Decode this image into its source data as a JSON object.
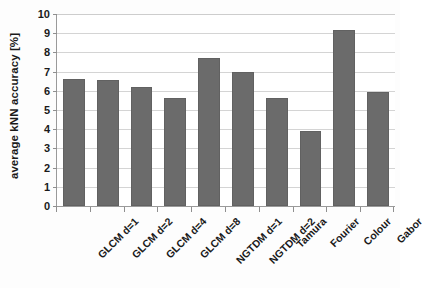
{
  "chart_data": {
    "type": "bar",
    "title": "",
    "subtitle": "",
    "xlabel": "",
    "ylabel": "average kNN accuracy [%]",
    "categories": [
      "GLCM d=1",
      "GLCM d=2",
      "GLCM d=4",
      "GLCM d=8",
      "NGTDM d=1",
      "NGTDM d=2",
      "Tamura",
      "Fourier",
      "Colour",
      "Gabor"
    ],
    "values": [
      6.6,
      6.55,
      6.2,
      5.65,
      7.7,
      7.0,
      5.6,
      3.9,
      9.15,
      5.95
    ],
    "ylim": [
      0,
      10
    ],
    "xlim_note": "categorical",
    "ytick_labels": [
      "0",
      "1",
      "2",
      "3",
      "4",
      "5",
      "6",
      "7",
      "8",
      "9",
      "10"
    ],
    "ytick_values": [
      0,
      1,
      2,
      3,
      4,
      5,
      6,
      7,
      8,
      9,
      10
    ],
    "grid": "horizontal",
    "legend": "none",
    "bar_color": "#6b6b6b",
    "gridline_color": "#d4d4d4",
    "axis_color": "#9a9a9a",
    "background_color": "#ffffff",
    "annotations": []
  }
}
